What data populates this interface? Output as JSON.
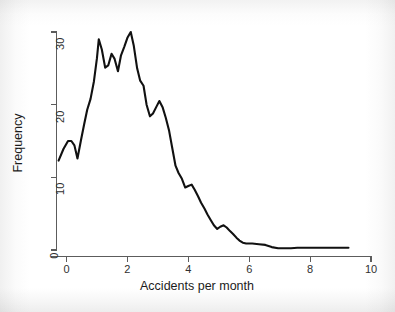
{
  "chart_data": {
    "type": "line",
    "title": "",
    "xlabel": "Accidents per month",
    "ylabel": "Frequency",
    "xlim": [
      -0.45,
      10.3
    ],
    "ylim": [
      -1.2,
      31.5
    ],
    "xticks": [
      0,
      2,
      4,
      6,
      8,
      10
    ],
    "xtick_labels": [
      "0",
      "2",
      "4",
      "6",
      "8",
      "10"
    ],
    "yticks": [
      0,
      10,
      20,
      30
    ],
    "ytick_labels": [
      "0",
      "10",
      "20",
      "30"
    ],
    "grid": false,
    "legend": false,
    "legend_position": "none",
    "line_color": "#111111",
    "axis_color": "#5c5c5c",
    "background_color": "#ffffff",
    "series": [
      {
        "name": "Frequency",
        "x": [
          -0.26,
          -0.1,
          0.05,
          0.16,
          0.26,
          0.36,
          0.47,
          0.58,
          0.68,
          0.79,
          0.9,
          1.0,
          1.06,
          1.16,
          1.27,
          1.37,
          1.48,
          1.58,
          1.69,
          1.79,
          1.9,
          2.0,
          2.11,
          2.21,
          2.32,
          2.42,
          2.53,
          2.63,
          2.74,
          2.84,
          2.95,
          3.05,
          3.16,
          3.26,
          3.37,
          3.47,
          3.58,
          3.68,
          3.79,
          3.9,
          4.0,
          4.11,
          4.21,
          4.32,
          4.42,
          4.53,
          4.63,
          4.74,
          4.84,
          4.95,
          5.05,
          5.16,
          5.26,
          5.37,
          5.47,
          5.58,
          5.68,
          5.79,
          5.9,
          6.1,
          6.32,
          6.53,
          6.74,
          6.95,
          7.16,
          7.37,
          7.58,
          7.79,
          8.0,
          8.32,
          8.63,
          8.95,
          9.26
        ],
        "y": [
          12.3,
          13.9,
          15.0,
          15.0,
          14.4,
          12.6,
          15.0,
          17.3,
          19.3,
          20.8,
          23.2,
          26.4,
          29.0,
          27.6,
          25.1,
          25.4,
          27.0,
          26.3,
          24.6,
          26.8,
          28.0,
          29.2,
          30.0,
          28.1,
          25.0,
          23.3,
          22.6,
          20.0,
          18.4,
          18.8,
          19.7,
          20.5,
          19.6,
          18.2,
          16.4,
          14.1,
          11.6,
          10.6,
          9.8,
          8.6,
          8.8,
          9.0,
          8.3,
          7.4,
          6.5,
          5.7,
          4.9,
          4.1,
          3.4,
          2.9,
          3.2,
          3.4,
          3.1,
          2.6,
          2.2,
          1.7,
          1.3,
          1.0,
          0.9,
          0.9,
          0.8,
          0.7,
          0.4,
          0.25,
          0.25,
          0.25,
          0.3,
          0.3,
          0.3,
          0.3,
          0.3,
          0.3,
          0.3
        ]
      }
    ]
  },
  "axes": {
    "x_title": "Accidents per month",
    "y_title": "Frequency",
    "x_tick_labels": [
      "0",
      "2",
      "4",
      "6",
      "8",
      "10"
    ],
    "y_tick_labels": [
      "0",
      "10",
      "20",
      "30"
    ]
  }
}
